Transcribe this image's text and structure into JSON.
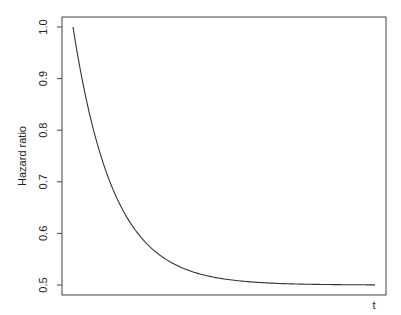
{
  "chart_data": {
    "type": "line",
    "title": "",
    "xlabel": "t",
    "ylabel": "Hazard ratio",
    "ylim": [
      0.5,
      1.0
    ],
    "y_ticks": [
      0.5,
      0.6,
      0.7,
      0.8,
      0.9,
      1.0
    ],
    "y_tick_labels": [
      "0.5",
      "0.6",
      "0.7",
      "0.8",
      "0.9",
      "1.0"
    ],
    "x_ticks": [],
    "grid": false,
    "legend": null,
    "series": [
      {
        "name": "Hazard ratio",
        "x": [
          0,
          0.5,
          1,
          1.5,
          2,
          2.5,
          3,
          3.5,
          4,
          4.5,
          5,
          5.5,
          6,
          6.5,
          7,
          7.5
        ],
        "values": [
          1.0,
          0.803,
          0.684,
          0.612,
          0.568,
          0.541,
          0.525,
          0.515,
          0.509,
          0.506,
          0.503,
          0.502,
          0.501,
          0.501,
          0.5,
          0.5
        ]
      }
    ]
  },
  "plot": {
    "box": {
      "left": 62,
      "top": 17,
      "right": 386,
      "bottom": 295
    },
    "y_pixel": {
      "1.0": 27,
      "0.5": 285
    },
    "curve_x_start": 73,
    "curve_x_end": 375,
    "line_color": "#333333",
    "axis_color": "#444444"
  }
}
